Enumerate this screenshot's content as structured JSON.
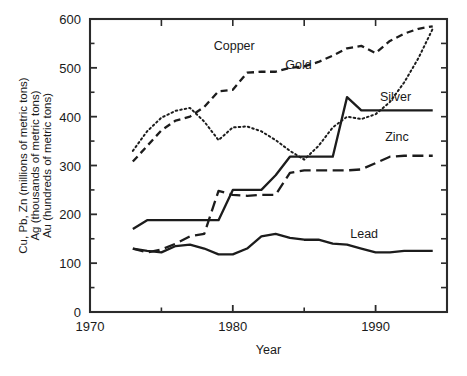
{
  "chart_data": {
    "type": "line",
    "title": "",
    "xlabel": "Year",
    "ylabel_lines": [
      "Cu, Pb, Zn (millions of metric tons)",
      "Ag (thousands of metric tons)",
      "Au (hundreds of metric tons)"
    ],
    "xlim": [
      1970,
      1995
    ],
    "ylim": [
      0,
      600
    ],
    "xticks": [
      1970,
      1980,
      1990
    ],
    "xticklabels": [
      "1970",
      "1980",
      "1990"
    ],
    "xminorticks": [
      1975,
      1985
    ],
    "yticks": [
      0,
      100,
      200,
      300,
      400,
      500,
      600
    ],
    "yticklabels": [
      "0",
      "100",
      "200",
      "300",
      "400",
      "500",
      "600"
    ],
    "yminorticks": [
      50,
      150,
      250,
      350,
      450,
      550
    ],
    "grid": false,
    "legend_position": "inline-labels",
    "x": [
      1973,
      1974,
      1975,
      1976,
      1977,
      1978,
      1979,
      1980,
      1981,
      1982,
      1983,
      1984,
      1985,
      1986,
      1987,
      1988,
      1989,
      1990,
      1991,
      1992,
      1993,
      1994
    ],
    "series": [
      {
        "name": "Copper",
        "style": "dashed",
        "label_x": 1980.1,
        "label_y": 537,
        "values": [
          308,
          340,
          372,
          392,
          400,
          420,
          452,
          455,
          490,
          492,
          492,
          500,
          503,
          512,
          525,
          540,
          545,
          530,
          555,
          570,
          580,
          585
        ]
      },
      {
        "name": "Gold",
        "style": "dotted",
        "label_x": 1984.6,
        "label_y": 497,
        "values": [
          330,
          370,
          398,
          412,
          418,
          390,
          352,
          378,
          380,
          370,
          352,
          330,
          312,
          340,
          378,
          400,
          395,
          405,
          430,
          470,
          520,
          580
        ]
      },
      {
        "name": "Silver",
        "style": "solid",
        "label_x": 1991.4,
        "label_y": 432,
        "values": [
          170,
          188,
          188,
          188,
          188,
          188,
          188,
          250,
          250,
          250,
          280,
          318,
          318,
          318,
          318,
          440,
          413,
          413,
          413,
          413,
          413,
          413
        ]
      },
      {
        "name": "Zinc",
        "style": "longdash",
        "label_x": 1991.5,
        "label_y": 350,
        "values": [
          130,
          122,
          128,
          140,
          155,
          160,
          248,
          240,
          238,
          240,
          240,
          285,
          290,
          290,
          290,
          290,
          292,
          305,
          318,
          320,
          320,
          320
        ]
      },
      {
        "name": "Lead",
        "style": "solid",
        "label_x": 1989.2,
        "label_y": 152,
        "values": [
          130,
          125,
          122,
          135,
          138,
          130,
          118,
          118,
          130,
          155,
          160,
          152,
          148,
          148,
          140,
          138,
          130,
          122,
          122,
          125,
          125,
          125
        ]
      }
    ]
  }
}
